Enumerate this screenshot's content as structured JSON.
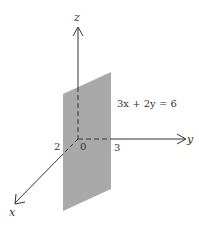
{
  "diagram": {
    "type": "3d-coordinate-plane",
    "equation": "3x + 2y = 6",
    "axes": {
      "x": {
        "label": "x",
        "intercept_label": "2"
      },
      "y": {
        "label": "y",
        "intercept_label": "3"
      },
      "z": {
        "label": "z"
      }
    },
    "origin_label": "0",
    "colors": {
      "plane": "#a9a9a9",
      "axis": "#333333",
      "background": "#ffffff"
    }
  }
}
